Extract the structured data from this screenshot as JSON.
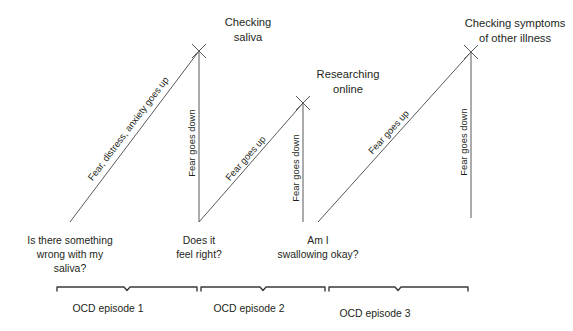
{
  "diagram": {
    "colors": {
      "line": "#58595b",
      "brace": "#3a3a3c",
      "text": "#231f20",
      "background": "#ffffff"
    },
    "peaks": [
      {
        "id": "peak-1",
        "label_line1": "Checking",
        "label_line2": "saliva",
        "x": 199,
        "y": 51
      },
      {
        "id": "peak-2",
        "label_line1": "Researching",
        "label_line2": "online",
        "x": 303,
        "y": 103
      },
      {
        "id": "peak-3",
        "label_line1": "Checking symptoms",
        "label_line2": "of other illness",
        "x": 471,
        "y": 52
      }
    ],
    "triggers": [
      {
        "id": "trigger-1",
        "lines": [
          "Is there something",
          "wrong with my",
          "saliva?"
        ],
        "x": 70,
        "y": 240
      },
      {
        "id": "trigger-2",
        "lines": [
          "Does it",
          "feel right?"
        ],
        "x": 199,
        "y": 240
      },
      {
        "id": "trigger-3",
        "lines": [
          "Am I",
          "swallowing okay?"
        ],
        "x": 318,
        "y": 240
      }
    ],
    "rise_labels": [
      {
        "id": "rise-1",
        "text": "Fear, distress, anxiety goes up"
      },
      {
        "id": "rise-2",
        "text": "Fear goes up"
      },
      {
        "id": "rise-3",
        "text": "Fear goes up"
      }
    ],
    "fall_labels": [
      {
        "id": "fall-1",
        "text": "Fear goes down"
      },
      {
        "id": "fall-2",
        "text": "Fear goes down"
      },
      {
        "id": "fall-3",
        "text": "Fear goes down"
      }
    ],
    "episodes": [
      {
        "id": "episode-1",
        "label": "OCD episode 1",
        "start": 57,
        "end": 197,
        "label_x": 108
      },
      {
        "id": "episode-2",
        "label": "OCD episode 2",
        "start": 201,
        "end": 325,
        "label_x": 249
      },
      {
        "id": "episode-3",
        "label": "OCD episode 3",
        "start": 329,
        "end": 468,
        "label_x": 347
      }
    ],
    "segments": [
      {
        "id": "segment-rise-1",
        "type": "rise",
        "x1": 70,
        "y1": 222,
        "x2": 199,
        "y2": 51
      },
      {
        "id": "segment-fall-1",
        "type": "fall",
        "x1": 199,
        "y1": 51,
        "x2": 199,
        "y2": 222
      },
      {
        "id": "segment-rise-2",
        "type": "rise",
        "x1": 199,
        "y1": 222,
        "x2": 303,
        "y2": 103
      },
      {
        "id": "segment-fall-2",
        "type": "fall",
        "x1": 303,
        "y1": 103,
        "x2": 303,
        "y2": 222
      },
      {
        "id": "segment-rise-3",
        "type": "rise",
        "x1": 318,
        "y1": 222,
        "x2": 471,
        "y2": 52
      },
      {
        "id": "segment-fall-3",
        "type": "fall",
        "x1": 471,
        "y1": 52,
        "x2": 471,
        "y2": 218
      }
    ],
    "brace_y": 287,
    "brace_notch_depth": 3.5,
    "brace_tip_depth": 4
  }
}
